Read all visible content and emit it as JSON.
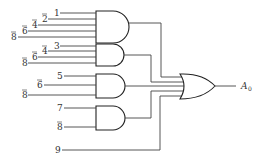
{
  "diagram": {
    "type": "logic-circuit",
    "output_label": "A",
    "output_subscript": "0",
    "and_gates": [
      {
        "inputs": [
          {
            "label": "1",
            "bar": false
          },
          {
            "label": "2",
            "bar": true
          },
          {
            "label": "4",
            "bar": true
          },
          {
            "label": "6",
            "bar": true
          },
          {
            "label": "8",
            "bar": true
          }
        ]
      },
      {
        "inputs": [
          {
            "label": "3",
            "bar": false
          },
          {
            "label": "4",
            "bar": true
          },
          {
            "label": "6",
            "bar": true
          },
          {
            "label": "8",
            "bar": true
          }
        ]
      },
      {
        "inputs": [
          {
            "label": "5",
            "bar": false
          },
          {
            "label": "6",
            "bar": true
          },
          {
            "label": "8",
            "bar": true
          }
        ]
      },
      {
        "inputs": [
          {
            "label": "7",
            "bar": false
          },
          {
            "label": "8",
            "bar": true
          }
        ]
      }
    ],
    "direct_input": {
      "label": "9",
      "bar": false
    },
    "or_gate": {
      "input_count": 5
    }
  },
  "labels": {
    "g1": [
      "1",
      "2",
      "4",
      "6",
      "8"
    ],
    "g2": [
      "3",
      "4",
      "6",
      "8"
    ],
    "g3": [
      "5",
      "6",
      "8"
    ],
    "g4": [
      "7",
      "8"
    ],
    "in9": "9",
    "out": "A",
    "out_sub": "0"
  }
}
